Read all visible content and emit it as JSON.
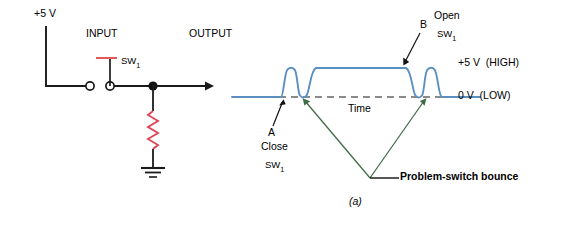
{
  "figure": {
    "caption": "(a)",
    "circuit": {
      "supply_label": "+5 V",
      "input_label": "INPUT",
      "output_label": "OUTPUT",
      "switch_label": "SW",
      "switch_subscript": "1",
      "wire_color": "#1a1a1a",
      "component_color": "#e05a5a",
      "resistor_color": "#e0465a"
    },
    "waveform": {
      "trace_color": "#5b8fc0",
      "baseline_dash_color": "#808080",
      "high_label_value": "+5 V",
      "high_label_state": "(HIGH)",
      "low_label_value": "0 V",
      "low_label_state": "(LOW)",
      "time_axis_label": "Time",
      "point_a": {
        "marker": "A",
        "line1": "Close",
        "line2": "SW",
        "line2_sub": "1"
      },
      "point_b": {
        "marker": "B",
        "line1": "Open",
        "line2": "SW",
        "line2_sub": "1"
      },
      "annotation": {
        "text": "Problem-switch bounce",
        "leader_color": "#3f6b45"
      }
    }
  }
}
